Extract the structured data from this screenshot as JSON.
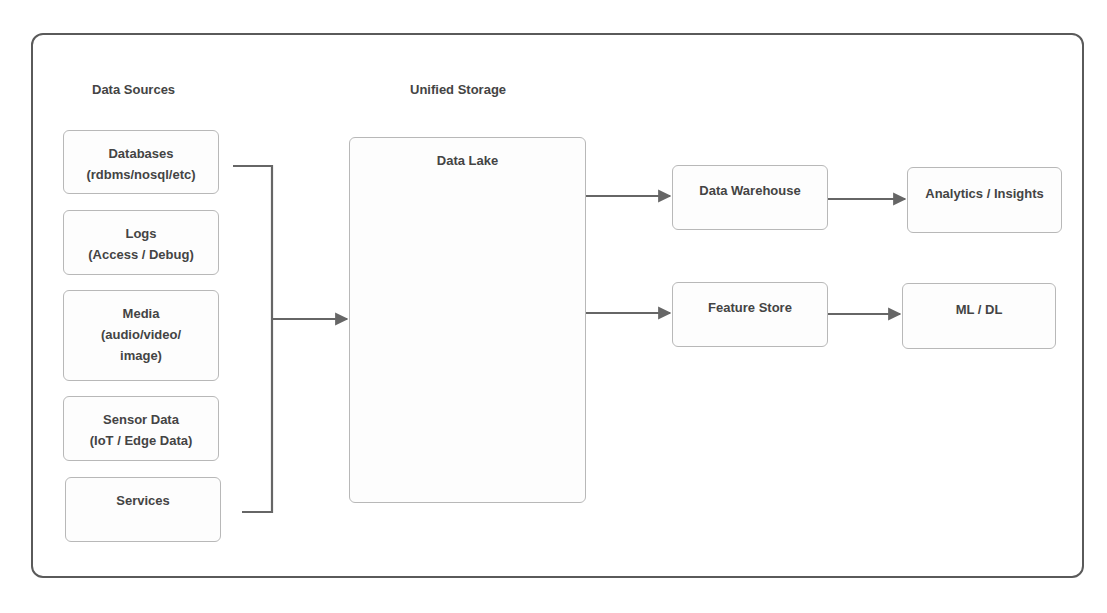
{
  "diagram": {
    "columns": {
      "sources_title": "Data Sources",
      "storage_title": "Unified Storage"
    },
    "sources": [
      {
        "title": "Databases",
        "subtitle": "(rdbms/nosql/etc)",
        "subtitle2": ""
      },
      {
        "title": "Logs",
        "subtitle": "(Access / Debug)",
        "subtitle2": ""
      },
      {
        "title": "Media",
        "subtitle": "(audio/video/",
        "subtitle2": "image)"
      },
      {
        "title": "Sensor Data",
        "subtitle": "(IoT / Edge Data)",
        "subtitle2": ""
      },
      {
        "title": "Services",
        "subtitle": "",
        "subtitle2": ""
      }
    ],
    "storage": {
      "title": "Data Lake"
    },
    "consumers": [
      {
        "title": "Data Warehouse"
      },
      {
        "title": "Feature Store"
      }
    ],
    "outputs": [
      {
        "title": "Analytics / Insights"
      },
      {
        "title": "ML / DL"
      }
    ],
    "edges": [
      {
        "from": "Data Sources",
        "to": "Data Lake"
      },
      {
        "from": "Data Lake",
        "to": "Data Warehouse"
      },
      {
        "from": "Data Lake",
        "to": "Feature Store"
      },
      {
        "from": "Data Warehouse",
        "to": "Analytics / Insights"
      },
      {
        "from": "Feature Store",
        "to": "ML / DL"
      }
    ],
    "colors": {
      "frame": "#5a5a5a",
      "node_border": "#b8b8b8",
      "connector": "#666666",
      "text": "#444444"
    }
  }
}
